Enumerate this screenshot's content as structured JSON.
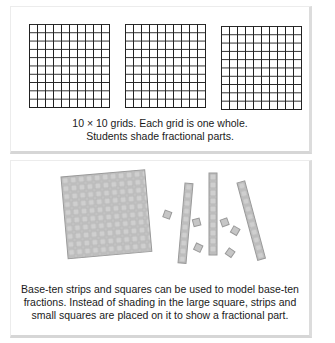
{
  "panels": [
    {
      "name": "ten-by-ten-grids",
      "grids": [
        {
          "rows": 10,
          "cols": 10,
          "shaded": 0
        },
        {
          "rows": 10,
          "cols": 10,
          "shaded": 0
        },
        {
          "rows": 10,
          "cols": 10,
          "shaded": 0
        }
      ],
      "caption": {
        "line1": "10 × 10 grids. Each grid is one whole.",
        "line2": "Students shade fractional parts."
      }
    },
    {
      "name": "base-ten-pieces",
      "pieces": {
        "large_square": {
          "rows": 10,
          "cols": 10
        },
        "strips": 4,
        "small_squares": 7
      },
      "caption": {
        "line1": "Base-ten strips and squares can be used to model base-ten",
        "line2": "fractions. Instead of shading in the large square, strips and",
        "line3": "small squares are placed on it to show a fractional part."
      }
    }
  ],
  "colors": {
    "grid_line": "#222222",
    "piece_fill": "#c4c4c4",
    "piece_line": "#9a9a9a",
    "panel_shadow": "#d6d6d6"
  }
}
